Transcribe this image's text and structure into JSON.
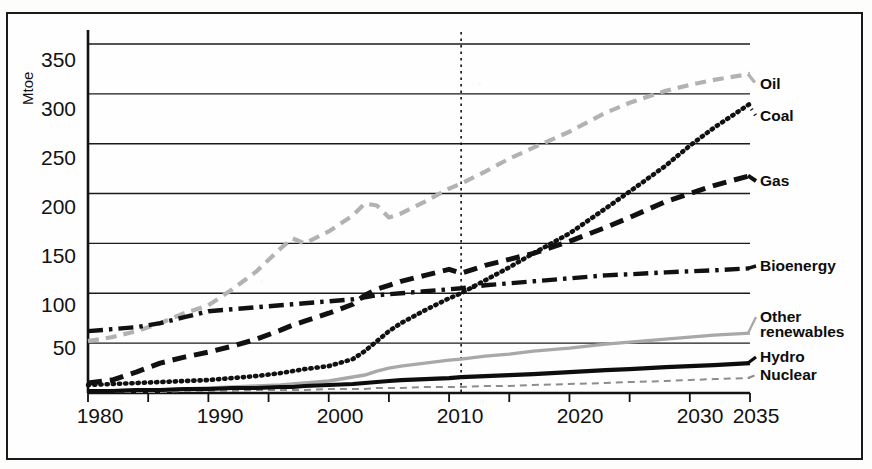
{
  "chart_data": {
    "type": "line",
    "title": "",
    "subtitle": "",
    "xlabel": "",
    "ylabel": "Mtoe",
    "xlim": [
      1980,
      2035
    ],
    "ylim": [
      0,
      360
    ],
    "grid": "horizontal",
    "legend_position": "right-inline",
    "annotations": [
      {
        "type": "vertical-dashed-line",
        "x": 2011,
        "label": ""
      }
    ],
    "xticks": [
      1980,
      1990,
      2000,
      2010,
      2020,
      2030,
      2035
    ],
    "xtick_labels": [
      "1980",
      "1990",
      "2000",
      "2010",
      "2020",
      "2030",
      "2035"
    ],
    "yticks": [
      50,
      100,
      150,
      200,
      250,
      300,
      350
    ],
    "ytick_labels": [
      "50",
      "100",
      "150",
      "200",
      "250",
      "300",
      "350"
    ],
    "x": [
      1980,
      1982,
      1984,
      1986,
      1988,
      1990,
      1992,
      1994,
      1996,
      1997,
      1998,
      2000,
      2002,
      2003,
      2004,
      2005,
      2006,
      2008,
      2010,
      2011,
      2013,
      2015,
      2017,
      2020,
      2023,
      2025,
      2028,
      2030,
      2032,
      2035
    ],
    "series": [
      {
        "name": "Oil",
        "color": "#b2b2b2",
        "style": "dashed",
        "values": [
          52,
          56,
          62,
          70,
          80,
          88,
          104,
          122,
          145,
          155,
          150,
          162,
          178,
          190,
          188,
          176,
          180,
          192,
          205,
          210,
          222,
          235,
          246,
          262,
          281,
          291,
          303,
          309,
          314,
          320
        ]
      },
      {
        "name": "Coal",
        "color": "#111111",
        "style": "dotted",
        "values": [
          8,
          9,
          10,
          11,
          12,
          13,
          15,
          17,
          20,
          22,
          24,
          27,
          34,
          42,
          52,
          62,
          70,
          83,
          95,
          100,
          113,
          126,
          140,
          160,
          185,
          202,
          228,
          248,
          266,
          290
        ]
      },
      {
        "name": "Gas",
        "color": "#111111",
        "style": "dashed-bold",
        "values": [
          10,
          13,
          21,
          30,
          36,
          41,
          47,
          54,
          63,
          68,
          72,
          80,
          89,
          98,
          104,
          108,
          112,
          118,
          124,
          120,
          128,
          134,
          140,
          152,
          166,
          176,
          192,
          200,
          208,
          218
        ]
      },
      {
        "name": "Bioenergy",
        "color": "#111111",
        "style": "dash-dot",
        "values": [
          62,
          64,
          66,
          70,
          76,
          82,
          84,
          86,
          88,
          89,
          90,
          92,
          94,
          96,
          98,
          99,
          100,
          102,
          104,
          105,
          108,
          110,
          112,
          115,
          118,
          119,
          121,
          122,
          123,
          125
        ]
      },
      {
        "name": "Other renewables",
        "color": "#a8a8a8",
        "style": "solid",
        "values": [
          2,
          2,
          3,
          3,
          4,
          5,
          6,
          7,
          8,
          9,
          10,
          12,
          16,
          18,
          22,
          25,
          27,
          30,
          33,
          34,
          37,
          39,
          42,
          45,
          49,
          51,
          54,
          56,
          58,
          60
        ]
      },
      {
        "name": "Hydro",
        "color": "#0d0d0d",
        "style": "solid-bold",
        "values": [
          2,
          2,
          3,
          3,
          4,
          4,
          5,
          5,
          6,
          6,
          7,
          8,
          9,
          10,
          11,
          12,
          13,
          14,
          15,
          16,
          17,
          18,
          19,
          21,
          23,
          24,
          26,
          27,
          28,
          30
        ]
      },
      {
        "name": "Nuclear",
        "color": "#8d8d8d",
        "style": "fine-dashed",
        "values": [
          1,
          1,
          1,
          1,
          2,
          2,
          2,
          3,
          3,
          3,
          3,
          4,
          4,
          4,
          5,
          5,
          5,
          6,
          6,
          6,
          7,
          7,
          8,
          9,
          10,
          11,
          12,
          13,
          14,
          15
        ]
      }
    ],
    "series_labels": [
      {
        "name": "Oil",
        "label": "Oil",
        "y_px": 89
      },
      {
        "name": "Coal",
        "label": "Coal",
        "y_px": 121
      },
      {
        "name": "Gas",
        "label": "Gas",
        "y_px": 186
      },
      {
        "name": "Bioenergy",
        "label": "Bioenergy",
        "y_px": 271
      },
      {
        "name": "Other renewables",
        "label": "Other\nrenewables",
        "line1": "Other",
        "line2": "renewables",
        "y_px": 322
      },
      {
        "name": "Hydro",
        "label": "Hydro",
        "y_px": 362
      },
      {
        "name": "Nuclear",
        "label": "Nuclear",
        "y_px": 380
      }
    ]
  },
  "axis": {
    "y_title": "Mtoe"
  },
  "labels": {
    "oil": "Oil",
    "coal": "Coal",
    "gas": "Gas",
    "bioenergy": "Bioenergy",
    "other_renewables_line1": "Other",
    "other_renewables_line2": "renewables",
    "hydro": "Hydro",
    "nuclear": "Nuclear"
  },
  "ytick_labels": {
    "t350": "350",
    "t300": "300",
    "t250": "250",
    "t200": "200",
    "t150": "150",
    "t100": "100",
    "t50": "50"
  },
  "xtick_labels": {
    "x1980": "1980",
    "x1990": "1990",
    "x2000": "2000",
    "x2010": "2010",
    "x2020": "2020",
    "x2030": "2030",
    "x2035": "2035"
  }
}
